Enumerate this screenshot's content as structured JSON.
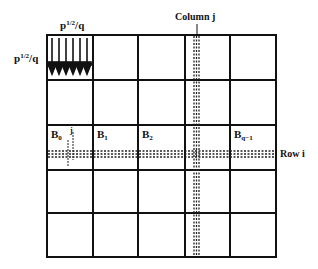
{
  "diagram": {
    "grid": {
      "rows": 5,
      "cols": 5
    },
    "labels": {
      "top_block_width": {
        "base": "p",
        "sup": "1/2",
        "tail": "/q"
      },
      "left_block_height": {
        "base": "p",
        "sup": "1/2",
        "tail": "/q"
      },
      "column_label": "Column j",
      "row_label": "Row i",
      "blocks": [
        {
          "base": "B",
          "sub": "0"
        },
        {
          "base": "B",
          "sub": "1"
        },
        {
          "base": "B",
          "sub": "2"
        },
        {
          "base": "B",
          "sub": "q−1"
        }
      ],
      "small_j_marks": [
        "j",
        "j"
      ]
    },
    "colors": {
      "line": "#111111",
      "background": "#ffffff"
    }
  }
}
